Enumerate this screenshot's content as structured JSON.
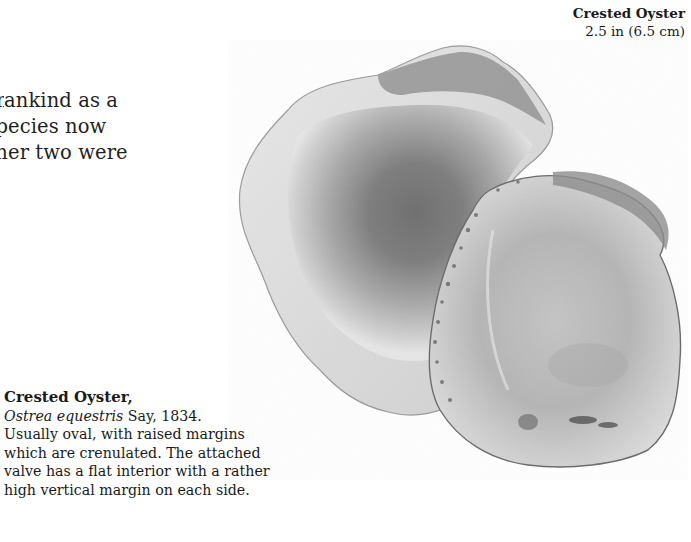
{
  "body_text": {
    "lines": [
      "ankind as a",
      "ecies now",
      "er two were"
    ],
    "prefix_fragments": [
      "m",
      "sp",
      "oth"
    ]
  },
  "size_label": {
    "name": "Crested Oyster",
    "size": "2.5 in (6.5 cm)"
  },
  "specimen": {
    "subject": "Crested Oyster shell (two valves)",
    "style": "greyscale photograph"
  },
  "caption": {
    "title": "Crested Oyster,",
    "scientific_name": "Ostrea equestris",
    "authority": " Say, 1834.",
    "description_lines": [
      "Usually oval, with raised margins",
      "which are crenulated. The attached",
      "valve has a flat interior with a rather",
      "high vertical margin on each side."
    ]
  }
}
